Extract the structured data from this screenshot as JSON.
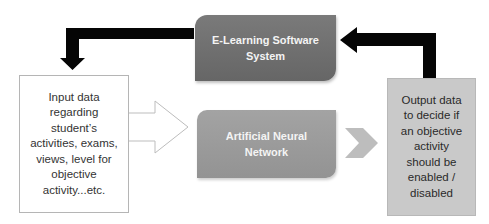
{
  "diagram": {
    "type": "flowchart",
    "nodes": {
      "input": {
        "label": "Input data regarding student’s activities, exams, views, level for objective activity...etc.",
        "lines": [
          "Input data",
          "regarding",
          "student’s",
          "activities, exams,",
          "views, level for",
          "objective",
          "activity...etc."
        ]
      },
      "elearning": {
        "label": "E-Learning Software System",
        "lines": [
          "E-Learning Software",
          "System"
        ]
      },
      "ann": {
        "label": "Artificial Neural Network",
        "lines": [
          "Artificial Neural",
          "Network"
        ]
      },
      "output": {
        "label": "Output data to decide if an objective activity should be enabled / disabled",
        "lines": [
          "Output data",
          "to decide if",
          "an objective",
          "activity",
          "should be",
          "enabled /",
          "disabled"
        ]
      }
    },
    "edges": [
      {
        "from": "elearning",
        "to": "input",
        "style": "black-elbow-arrow"
      },
      {
        "from": "input",
        "to": "ann",
        "style": "hollow-block-arrow"
      },
      {
        "from": "ann",
        "to": "output",
        "style": "gray-chevron"
      },
      {
        "from": "output",
        "to": "elearning",
        "style": "black-elbow-arrow"
      }
    ],
    "colors": {
      "elearning_fill": "#6e6e6e",
      "ann_fill": "#9b9b9b",
      "output_fill": "#c9c9c9",
      "chevron_fill": "#bdbdbd",
      "arrow_black": "#000000",
      "input_border": "#b5b5b5"
    }
  }
}
